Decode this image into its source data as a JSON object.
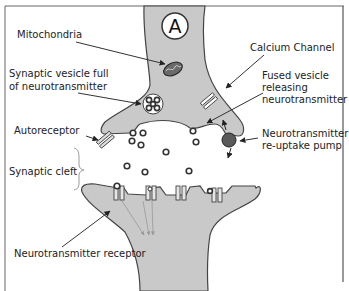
{
  "diagram": {
    "title_marker": "A",
    "labels": {
      "mitochondria": "Mitochondria",
      "synaptic_vesicle_line1": "Synaptic vesicle full",
      "synaptic_vesicle_line2": "of neurotransmitter",
      "autoreceptor": "Autoreceptor",
      "synaptic_cleft": "Synaptic cleft",
      "neurotransmitter_receptor": "Neurotransmitter receptor",
      "calcium_channel": "Calcium Channel",
      "fused_vesicle_line1": "Fused vesicle",
      "fused_vesicle_line2": "releasing",
      "fused_vesicle_line3": "neurotransmitter",
      "reuptake_line1": "Neurotransmitter",
      "reuptake_line2": "re-uptake pump"
    },
    "colors": {
      "neuron_fill": "#c9c9c9",
      "outline": "#444444",
      "reuptake_pump": "#5a5a5a",
      "text": "#222222",
      "frame": "#555555"
    }
  }
}
